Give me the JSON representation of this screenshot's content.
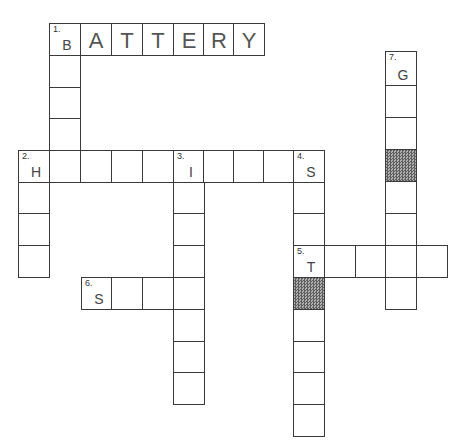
{
  "puzzle": {
    "title": "Crossword",
    "shade_color": "#777777",
    "cells": [
      {
        "x": 49,
        "y": 23,
        "w": 31,
        "h": 32,
        "num": "1.",
        "letter": "B",
        "big": false
      },
      {
        "x": 80,
        "y": 23,
        "w": 31,
        "h": 32,
        "letter": "A",
        "big": true
      },
      {
        "x": 111,
        "y": 23,
        "w": 31,
        "h": 32,
        "letter": "T",
        "big": true
      },
      {
        "x": 142,
        "y": 23,
        "w": 31,
        "h": 32,
        "letter": "T",
        "big": true
      },
      {
        "x": 173,
        "y": 23,
        "w": 31,
        "h": 32,
        "letter": "E",
        "big": true
      },
      {
        "x": 203,
        "y": 23,
        "w": 31,
        "h": 32,
        "letter": "R",
        "big": true
      },
      {
        "x": 233,
        "y": 23,
        "w": 31,
        "h": 32,
        "letter": "Y",
        "big": true
      },
      {
        "x": 49,
        "y": 55,
        "w": 31,
        "h": 32
      },
      {
        "x": 49,
        "y": 87,
        "w": 31,
        "h": 32
      },
      {
        "x": 49,
        "y": 118,
        "w": 31,
        "h": 33
      },
      {
        "x": 18,
        "y": 150,
        "w": 31,
        "h": 32,
        "num": "2.",
        "letter": "H"
      },
      {
        "x": 49,
        "y": 150,
        "w": 31,
        "h": 32
      },
      {
        "x": 80,
        "y": 150,
        "w": 31,
        "h": 32
      },
      {
        "x": 111,
        "y": 150,
        "w": 31,
        "h": 32
      },
      {
        "x": 142,
        "y": 150,
        "w": 31,
        "h": 32
      },
      {
        "x": 173,
        "y": 150,
        "w": 31,
        "h": 32,
        "num": "3.",
        "letter": "I"
      },
      {
        "x": 203,
        "y": 150,
        "w": 31,
        "h": 32
      },
      {
        "x": 233,
        "y": 150,
        "w": 31,
        "h": 32
      },
      {
        "x": 263,
        "y": 150,
        "w": 31,
        "h": 32
      },
      {
        "x": 293,
        "y": 150,
        "w": 31,
        "h": 32,
        "num": "4.",
        "letter": "S"
      },
      {
        "x": 18,
        "y": 182,
        "w": 31,
        "h": 32
      },
      {
        "x": 18,
        "y": 213,
        "w": 31,
        "h": 33
      },
      {
        "x": 18,
        "y": 245,
        "w": 31,
        "h": 32
      },
      {
        "x": 173,
        "y": 182,
        "w": 31,
        "h": 32
      },
      {
        "x": 173,
        "y": 213,
        "w": 31,
        "h": 33
      },
      {
        "x": 173,
        "y": 245,
        "w": 31,
        "h": 32
      },
      {
        "x": 173,
        "y": 277,
        "w": 31,
        "h": 32
      },
      {
        "x": 173,
        "y": 309,
        "w": 31,
        "h": 32
      },
      {
        "x": 173,
        "y": 341,
        "w": 31,
        "h": 32
      },
      {
        "x": 173,
        "y": 372,
        "w": 31,
        "h": 32
      },
      {
        "x": 293,
        "y": 182,
        "w": 31,
        "h": 32
      },
      {
        "x": 293,
        "y": 213,
        "w": 31,
        "h": 33
      },
      {
        "x": 293,
        "y": 245,
        "w": 31,
        "h": 32,
        "num": "5.",
        "letter": "T"
      },
      {
        "x": 293,
        "y": 277,
        "w": 31,
        "h": 32,
        "shaded": true
      },
      {
        "x": 293,
        "y": 309,
        "w": 31,
        "h": 32
      },
      {
        "x": 293,
        "y": 341,
        "w": 31,
        "h": 32
      },
      {
        "x": 293,
        "y": 372,
        "w": 31,
        "h": 32
      },
      {
        "x": 293,
        "y": 404,
        "w": 31,
        "h": 32
      },
      {
        "x": 324,
        "y": 245,
        "w": 31,
        "h": 32
      },
      {
        "x": 355,
        "y": 245,
        "w": 31,
        "h": 32
      },
      {
        "x": 385,
        "y": 245,
        "w": 31,
        "h": 32
      },
      {
        "x": 416,
        "y": 245,
        "w": 31,
        "h": 32
      },
      {
        "x": 81,
        "y": 277,
        "w": 31,
        "h": 32,
        "num": "6.",
        "letter": "S"
      },
      {
        "x": 111,
        "y": 277,
        "w": 31,
        "h": 32
      },
      {
        "x": 142,
        "y": 277,
        "w": 31,
        "h": 32
      },
      {
        "x": 385,
        "y": 51,
        "w": 31,
        "h": 34,
        "num": "7.",
        "letter": "G"
      },
      {
        "x": 385,
        "y": 85,
        "w": 31,
        "h": 32
      },
      {
        "x": 385,
        "y": 117,
        "w": 31,
        "h": 32
      },
      {
        "x": 385,
        "y": 149,
        "w": 31,
        "h": 32,
        "shaded": true
      },
      {
        "x": 385,
        "y": 181,
        "w": 31,
        "h": 32
      },
      {
        "x": 385,
        "y": 213,
        "w": 31,
        "h": 32
      },
      {
        "x": 385,
        "y": 277,
        "w": 31,
        "h": 32
      }
    ],
    "clues": [
      {
        "number": "1",
        "direction": "across",
        "start_letter": "B",
        "answer_shown": "BATTERY",
        "length": 7
      },
      {
        "number": "1",
        "direction": "down",
        "start_letter": "B",
        "length": 5
      },
      {
        "number": "2",
        "direction": "across",
        "start_letter": "H",
        "length": 10
      },
      {
        "number": "2",
        "direction": "down",
        "start_letter": "H",
        "length": 4
      },
      {
        "number": "3",
        "direction": "down",
        "start_letter": "I",
        "length": 8
      },
      {
        "number": "4",
        "direction": "down",
        "start_letter": "S",
        "length": 9
      },
      {
        "number": "5",
        "direction": "across",
        "start_letter": "T",
        "length": 5
      },
      {
        "number": "6",
        "direction": "across",
        "start_letter": "S",
        "length": 4
      },
      {
        "number": "7",
        "direction": "down",
        "start_letter": "G",
        "length": 8
      }
    ]
  }
}
